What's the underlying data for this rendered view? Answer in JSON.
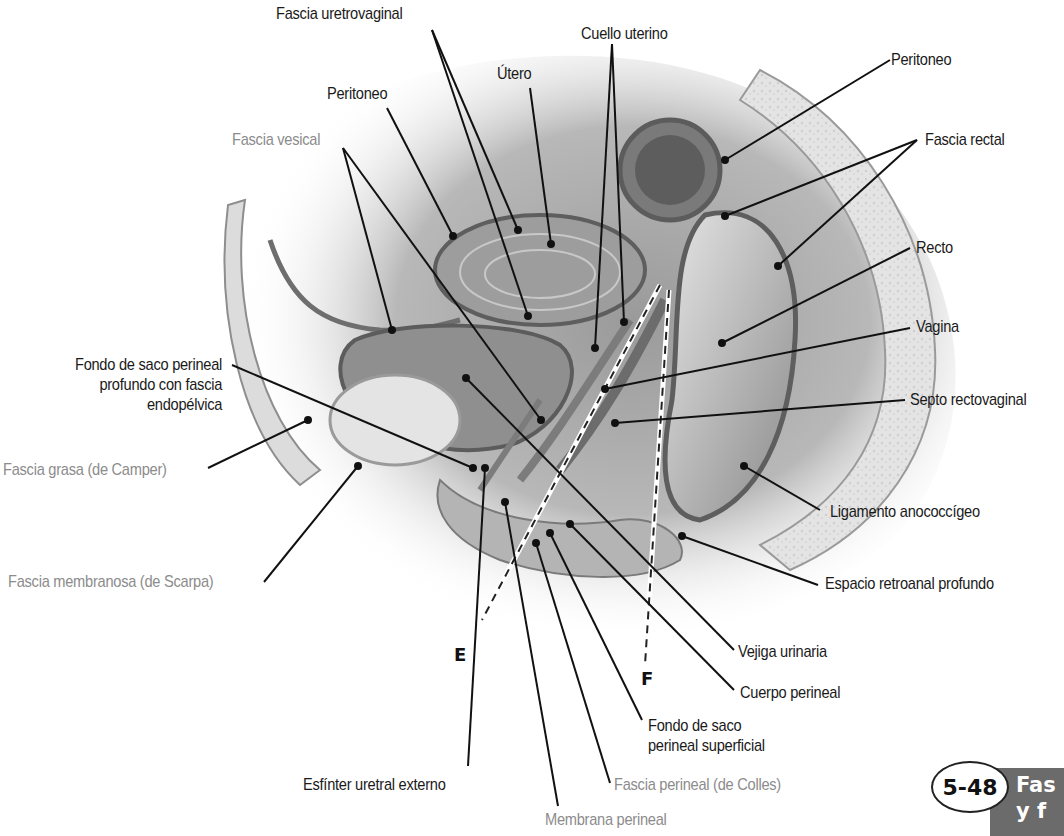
{
  "figure": {
    "number": "5-48",
    "title_visible": "Fas\ny f",
    "colors": {
      "label_black": "#1a1a1a",
      "label_gray": "#8c8c8c",
      "title_bar": "#6b6b6b"
    }
  },
  "section_planes": [
    {
      "id": "E",
      "label": "E"
    },
    {
      "id": "F",
      "label": "F"
    }
  ],
  "labels": {
    "fascia_uretrovaginal": "Fascia uretrovaginal",
    "cuello_uterino": "Cuello uterino",
    "utero": "Útero",
    "peritoneo_left": "Peritoneo",
    "fascia_vesical": "Fascia vesical",
    "peritoneo_right": "Peritoneo",
    "fascia_rectal": "Fascia rectal",
    "recto": "Recto",
    "vagina": "Vagina",
    "fondo_saco_profundo": "Fondo de saco perineal\nprofundo con fascia\nendopélvica",
    "septo_rectovaginal": "Septo rectovaginal",
    "fascia_grasa": "Fascia grasa (de Camper)",
    "ligamento_anococcigeo": "Ligamento anococcígeo",
    "fascia_membranosa": "Fascia membranosa (de Scarpa)",
    "espacio_retroanal": "Espacio retroanal profundo",
    "vejiga_urinaria": "Vejiga urinaria",
    "cuerpo_perineal": "Cuerpo perineal",
    "fondo_saco_superficial": "Fondo de saco\nperineal superficial",
    "esfinter_uretral": "Esfínter uretral externo",
    "fascia_perineal": "Fascia perineal (de Colles)",
    "membrana_perineal": "Membrana perineal"
  }
}
